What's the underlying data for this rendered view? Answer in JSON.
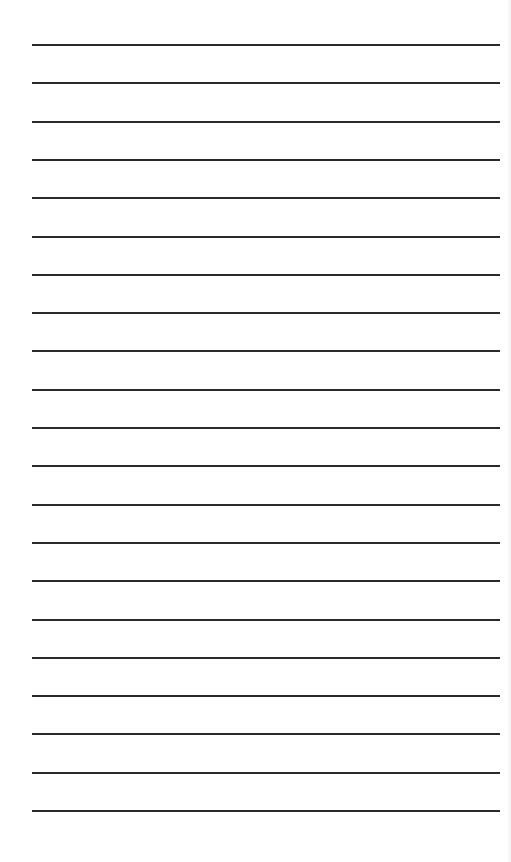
{
  "page": {
    "type": "lined-paper",
    "background_color": "#ffffff",
    "line_color": "#2a2a2a",
    "line_count": 21,
    "first_line_y": 44,
    "line_spacing": 38.3,
    "line_left": 32,
    "line_width": 468
  }
}
